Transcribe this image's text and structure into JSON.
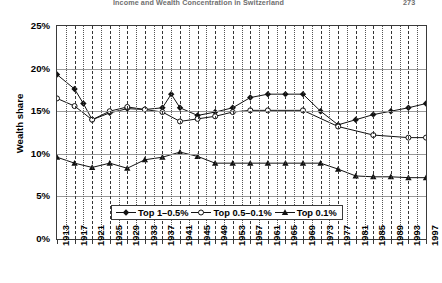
{
  "header": {
    "title": "Income and Wealth Concentration in Switzerland",
    "page": "273"
  },
  "chart_data": {
    "type": "line",
    "title": "",
    "xlabel": "",
    "ylabel": "Wealth share",
    "xlim": [
      1913,
      1997
    ],
    "ylim": [
      0,
      0.25
    ],
    "ytick_labels": [
      "0%",
      "5%",
      "10%",
      "15%",
      "20%",
      "25%"
    ],
    "ytick_values": [
      0,
      5,
      10,
      15,
      20,
      25
    ],
    "grid": "both",
    "legend_position": "bottom-center",
    "x": [
      1913,
      1915,
      1917,
      1919,
      1921,
      1923,
      1925,
      1927,
      1929,
      1931,
      1933,
      1935,
      1937,
      1939,
      1941,
      1943,
      1945,
      1947,
      1949,
      1951,
      1953,
      1955,
      1957,
      1961,
      1965,
      1969,
      1973,
      1977,
      1981,
      1985,
      1989,
      1993,
      1997
    ],
    "xtick_labels": [
      "1913",
      "1917",
      "1921",
      "1925",
      "1929",
      "1933",
      "1937",
      "1941",
      "1945",
      "1949",
      "1953",
      "1957",
      "1961",
      "1965",
      "1969",
      "1973",
      "1977",
      "1981",
      "1985",
      "1989",
      "1993",
      "1997"
    ],
    "series": [
      {
        "name": "Top 1–0.5%",
        "marker": "diamond-filled",
        "x": [
          1913,
          1917,
          1919,
          1921,
          1925,
          1929,
          1933,
          1937,
          1939,
          1941,
          1945,
          1949,
          1953,
          1957,
          1961,
          1965,
          1969,
          1973,
          1977,
          1981,
          1985,
          1989,
          1993,
          1997
        ],
        "values": [
          19.3,
          17.6,
          15.9,
          14.0,
          14.8,
          15.3,
          15.2,
          15.4,
          17.0,
          15.4,
          14.5,
          14.9,
          15.4,
          16.6,
          17.0,
          17.0,
          17.0,
          15.0,
          13.4,
          14.0,
          14.6,
          15.0,
          15.4,
          15.9
        ]
      },
      {
        "name": "Top 0.5–0.1%",
        "marker": "circle-open",
        "x": [
          1913,
          1917,
          1921,
          1925,
          1929,
          1933,
          1937,
          1941,
          1945,
          1949,
          1953,
          1957,
          1961,
          1969,
          1977,
          1985,
          1993,
          1997
        ],
        "values": [
          16.5,
          15.6,
          14.0,
          15.0,
          15.5,
          15.2,
          14.9,
          13.8,
          14.1,
          14.4,
          14.9,
          15.1,
          15.1,
          15.1,
          13.2,
          12.2,
          11.9,
          11.9
        ]
      },
      {
        "name": "Top 0.1%",
        "marker": "triangle-filled",
        "x": [
          1913,
          1917,
          1921,
          1925,
          1929,
          1933,
          1937,
          1941,
          1945,
          1949,
          1953,
          1957,
          1961,
          1965,
          1969,
          1973,
          1977,
          1981,
          1985,
          1989,
          1993,
          1997
        ],
        "values": [
          9.6,
          8.9,
          8.4,
          8.9,
          8.3,
          9.3,
          9.6,
          10.2,
          9.7,
          8.9,
          8.9,
          8.9,
          8.9,
          8.9,
          8.9,
          8.9,
          8.2,
          7.4,
          7.3,
          7.3,
          7.2,
          7.2
        ]
      }
    ]
  }
}
